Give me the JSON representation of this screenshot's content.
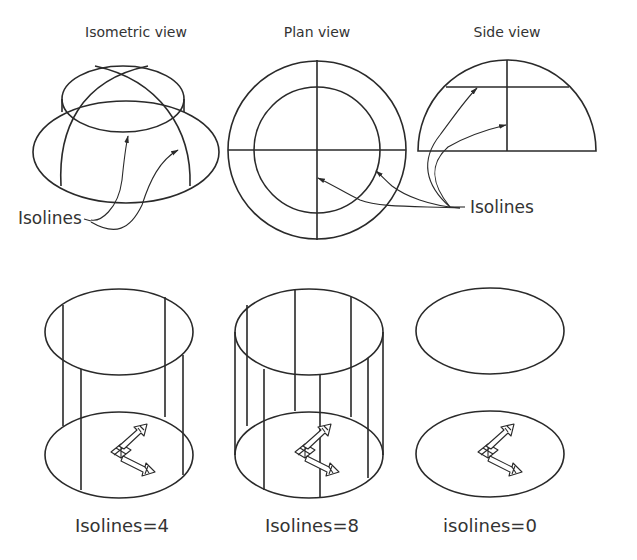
{
  "top_row": {
    "isometric": {
      "title": "Isometric view",
      "callout": "Isolines"
    },
    "plan": {
      "title": "Plan view"
    },
    "side": {
      "title": "Side view",
      "callout": "Isolines"
    }
  },
  "bottom_row": {
    "cyl4": {
      "caption": "Isolines=4",
      "isolines": 4
    },
    "cyl8": {
      "caption": "Isolines=8",
      "isolines": 8
    },
    "cyl0": {
      "caption": "isolines=0",
      "isolines": 0
    }
  },
  "icons": [
    "ucs-icon",
    "ucs-icon",
    "ucs-icon"
  ],
  "colors": {
    "line": "#2a2a2a",
    "text": "#333333",
    "background": "#ffffff"
  }
}
